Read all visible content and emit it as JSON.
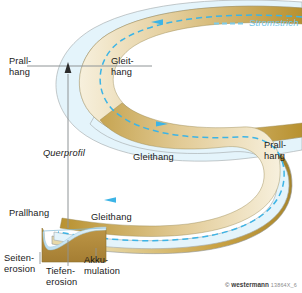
{
  "figure": {
    "title_hidden": "Flussmaeander - Prallhang und Gleithang",
    "legend": {
      "label": "Stromstrich",
      "color": "#7ecbe8",
      "style": "dashed"
    },
    "colors": {
      "water": "#e4f4fb",
      "water_outline": "#9aa0a2",
      "sandbank_light": "#f2e7cc",
      "sandbank_mid": "#d9bc7e",
      "sandbank_dark": "#a8802f",
      "bank_brown": "#b8912f",
      "flow_line": "#3cb4e6",
      "profile_ground": "#b08a3e",
      "profile_water": "#cfe8f5",
      "leader_line": "#8f9496",
      "text": "#1a1a1a"
    },
    "labels": {
      "prallhang_top_line1": "Prall-",
      "prallhang_top_line2": "hang",
      "gleithang_top_line1": "Gleit-",
      "gleithang_top_line2": "hang",
      "gleithang_mid": "Gleithang",
      "prallhang_right_line1": "Prall-",
      "prallhang_right_line2": "hang",
      "querprofil": "Querprofil"
    },
    "cross_section": {
      "prallhang": "Prallhang",
      "gleithang": "Gleithang",
      "seitenerosion_line1": "Seiten-",
      "seitenerosion_line2": "erosion",
      "tiefenerosion_line1": "Tiefen-",
      "tiefenerosion_line2": "erosion",
      "akkumulation_line1": "Akku-",
      "akkumulation_line2": "mulation"
    },
    "flow_arrows": [
      {
        "name": "flow-arrow-top",
        "direction": "left"
      },
      {
        "name": "flow-arrow-middle",
        "direction": "right"
      },
      {
        "name": "flow-arrow-bottom",
        "direction": "left"
      }
    ],
    "credit": {
      "symbol": "©",
      "publisher": "westermann",
      "code": "13864X_6"
    }
  }
}
